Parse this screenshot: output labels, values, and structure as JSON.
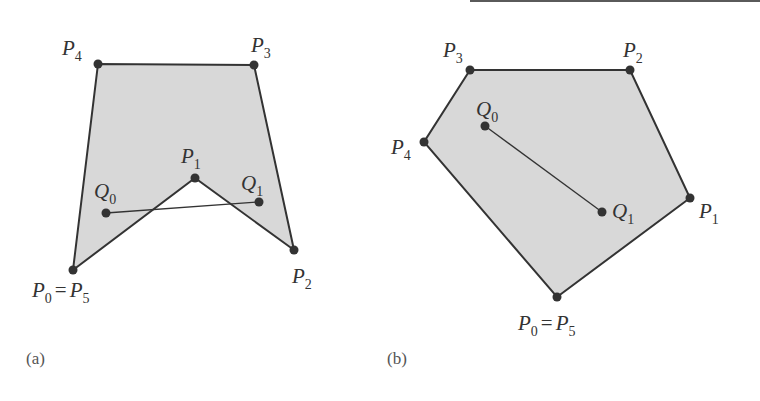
{
  "figures": [
    {
      "id": "a",
      "caption": "(a)",
      "caption_pos": [
        26,
        364
      ],
      "fill_color": "#d8d8d8",
      "stroke_color": "#333333",
      "polygon": [
        {
          "name": "P0",
          "x": 73,
          "y": 270
        },
        {
          "name": "P1",
          "x": 195,
          "y": 178
        },
        {
          "name": "P2",
          "x": 294,
          "y": 250
        },
        {
          "name": "P3",
          "x": 254,
          "y": 65
        },
        {
          "name": "P4",
          "x": 98,
          "y": 64
        }
      ],
      "segment": {
        "from": {
          "name": "Q0",
          "x": 106,
          "y": 213
        },
        "to": {
          "name": "Q1",
          "x": 259,
          "y": 202
        }
      },
      "labels": [
        {
          "main": "P",
          "sub": "4",
          "x": 62,
          "y": 55
        },
        {
          "main": "P",
          "sub": "3",
          "x": 251,
          "y": 52
        },
        {
          "main": "P",
          "sub": "1",
          "x": 181,
          "y": 163
        },
        {
          "main": "Q",
          "sub": "0",
          "x": 94,
          "y": 198
        },
        {
          "main": "Q",
          "sub": "1",
          "x": 241,
          "y": 190
        },
        {
          "main": "P",
          "sub": "2",
          "x": 292,
          "y": 283
        },
        {
          "main": "P",
          "sub": "0",
          "eq": "=",
          "main2": "P",
          "sub2": "5",
          "x": 32,
          "y": 297
        }
      ],
      "interior_note": "non-convex polygon; segment Q0Q1 leaves the polygon"
    },
    {
      "id": "b",
      "caption": "(b)",
      "caption_pos": [
        387,
        364
      ],
      "fill_color": "#d8d8d8",
      "stroke_color": "#333333",
      "polygon": [
        {
          "name": "P0",
          "x": 557,
          "y": 297
        },
        {
          "name": "P1",
          "x": 690,
          "y": 198
        },
        {
          "name": "P2",
          "x": 630,
          "y": 70
        },
        {
          "name": "P3",
          "x": 470,
          "y": 70
        },
        {
          "name": "P4",
          "x": 424,
          "y": 142
        }
      ],
      "segment": {
        "from": {
          "name": "Q0",
          "x": 485,
          "y": 126
        },
        "to": {
          "name": "Q1",
          "x": 602,
          "y": 212
        }
      },
      "labels": [
        {
          "main": "P",
          "sub": "3",
          "x": 443,
          "y": 57
        },
        {
          "main": "P",
          "sub": "2",
          "x": 623,
          "y": 57
        },
        {
          "main": "Q",
          "sub": "0",
          "x": 476,
          "y": 116
        },
        {
          "main": "P",
          "sub": "4",
          "x": 391,
          "y": 154
        },
        {
          "main": "Q",
          "sub": "1",
          "x": 612,
          "y": 218
        },
        {
          "main": "P",
          "sub": "1",
          "x": 699,
          "y": 218
        },
        {
          "main": "P",
          "sub": "0",
          "eq": "=",
          "main2": "P",
          "sub2": "5",
          "x": 518,
          "y": 330
        }
      ],
      "interior_note": "convex polygon; segment Q0Q1 lies inside"
    }
  ]
}
